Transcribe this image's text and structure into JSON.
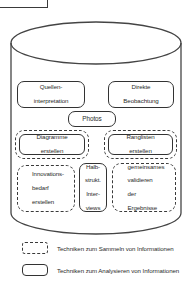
{
  "diagram": {
    "container": {
      "shape": "cylinder",
      "name": "techniques-cylinder"
    },
    "nodes": [
      {
        "id": "quellen",
        "label": "Quellen-\ninterpretation",
        "type": "solid",
        "category": "analyse"
      },
      {
        "id": "direkte",
        "label": "Direkte\nBeobachtung",
        "type": "solid",
        "category": "analyse"
      },
      {
        "id": "photos",
        "label": "Photos",
        "type": "solid",
        "category": "analyse"
      },
      {
        "id": "diagramme",
        "label": "Diagramme\nerstellen",
        "type": "nested",
        "category": "beides"
      },
      {
        "id": "rang",
        "label": "Ranglisten\nerstellen",
        "type": "nested",
        "category": "beides"
      },
      {
        "id": "innov",
        "label": "Innovations-\nbedarf\nerstellen",
        "type": "dashed",
        "category": "sammeln"
      },
      {
        "id": "halb",
        "label": "Halb-\nstrukt.\nInter-\nviews",
        "type": "solid",
        "category": "analyse"
      },
      {
        "id": "gemein",
        "label": "gemeinsames\nvalidieren\nder\nErgebnisse",
        "type": "dashed",
        "category": "sammeln"
      }
    ],
    "labels": {
      "quellen_l1": "Quellen-",
      "quellen_l2": "interpretation",
      "direkte_l1": "Direkte",
      "direkte_l2": "Beobachtung",
      "photos": "Photos",
      "diagramme_l1": "Diagramme",
      "diagramme_l2": "erstellen",
      "rang_l1": "Ranglisten",
      "rang_l2": "erstellen",
      "innov_l1": "Innovations-",
      "innov_l2": "bedarf",
      "innov_l3": "erstellen",
      "halb_l1": "Halb-",
      "halb_l2": "strukt.",
      "halb_l3": "Inter-",
      "halb_l4": "views",
      "gemein_l1": "gemeinsames",
      "gemein_l2": "validieren",
      "gemein_l3": "der",
      "gemein_l4": "Ergebnisse"
    }
  },
  "legend": {
    "items": [
      {
        "style": "dashed",
        "label": "Techniken zum Sammeln von Informationen"
      },
      {
        "style": "solid",
        "label": "Techniken zum Analysieren von Informationen"
      }
    ]
  },
  "colors": {
    "stroke": "#333333",
    "text": "#2b2b2b",
    "background": "#ffffff"
  }
}
